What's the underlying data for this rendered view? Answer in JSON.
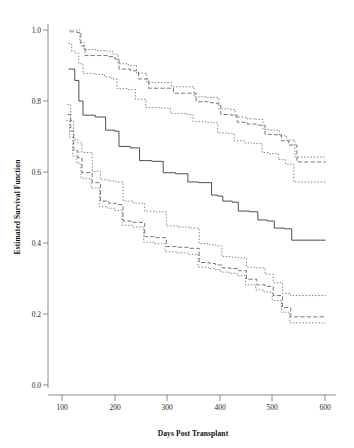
{
  "figure": {
    "background_color": "#ffffff",
    "type": "survival-curve-figure"
  },
  "chart_data": {
    "type": "line",
    "title": "",
    "subtitle": "",
    "xlabel": "Days Post Transplant",
    "ylabel": "Estimated Survival Function",
    "xlim": [
      60,
      620
    ],
    "ylim": [
      0.0,
      1.04
    ],
    "xticks": [
      100,
      200,
      300,
      400,
      500,
      600
    ],
    "xtick_labels": [
      "100",
      "200",
      "300",
      "400",
      "500",
      "600"
    ],
    "yticks": [
      0.0,
      0.2,
      0.4,
      0.6,
      0.8,
      1.0
    ],
    "ytick_labels": [
      "0.0",
      "0.2",
      "0.4",
      "0.6",
      "0.8",
      "1.0"
    ],
    "grid": false,
    "legend": false,
    "legend_position": "none",
    "step_interpolation": "post",
    "annotations": [],
    "series": [
      {
        "name": "Upper confidence band (dotted outer)",
        "style": "dotted",
        "color": "#6a6a6a",
        "x": [
          102,
          108,
          115,
          122,
          130,
          152,
          172,
          186,
          196,
          216,
          232,
          252,
          278,
          300,
          330,
          344,
          368,
          384,
          392,
          412,
          424,
          444,
          462,
          478,
          490,
          510,
          524,
          540,
          600
        ],
        "y": [
          1.0,
          1.0,
          1.0,
          0.965,
          0.945,
          0.942,
          0.94,
          0.932,
          0.905,
          0.9,
          0.878,
          0.852,
          0.852,
          0.84,
          0.84,
          0.812,
          0.81,
          0.81,
          0.778,
          0.776,
          0.755,
          0.75,
          0.748,
          0.72,
          0.718,
          0.702,
          0.69,
          0.642,
          0.642
        ]
      },
      {
        "name": "Upper confidence band (dashed middle)",
        "style": "dashed",
        "color": "#555555",
        "x": [
          102,
          108,
          116,
          124,
          132,
          154,
          176,
          190,
          198,
          220,
          236,
          256,
          282,
          304,
          332,
          348,
          372,
          388,
          396,
          416,
          428,
          448,
          466,
          482,
          494,
          514,
          528,
          544,
          600
        ],
        "y": [
          0.995,
          0.995,
          0.993,
          0.955,
          0.928,
          0.928,
          0.925,
          0.918,
          0.89,
          0.885,
          0.862,
          0.836,
          0.836,
          0.822,
          0.822,
          0.798,
          0.795,
          0.792,
          0.762,
          0.76,
          0.74,
          0.735,
          0.732,
          0.706,
          0.705,
          0.688,
          0.676,
          0.628,
          0.628
        ]
      },
      {
        "name": "Upper confidence band (dotted inner)",
        "style": "dotted",
        "color": "#6a6a6a",
        "x": [
          100,
          106,
          112,
          120,
          128,
          150,
          170,
          184,
          194,
          214,
          230,
          250,
          276,
          298,
          328,
          342,
          366,
          382,
          390,
          410,
          422,
          442,
          460,
          476,
          488,
          508,
          522,
          538,
          600
        ],
        "y": [
          0.962,
          0.94,
          0.935,
          0.905,
          0.878,
          0.875,
          0.868,
          0.862,
          0.835,
          0.832,
          0.805,
          0.782,
          0.78,
          0.765,
          0.762,
          0.742,
          0.74,
          0.738,
          0.71,
          0.708,
          0.688,
          0.682,
          0.68,
          0.655,
          0.652,
          0.635,
          0.622,
          0.572,
          0.572
        ]
      },
      {
        "name": "Estimated survival function (solid)",
        "style": "solid",
        "color": "#3b3b3b",
        "x": [
          100,
          106,
          112,
          120,
          128,
          152,
          172,
          190,
          198,
          220,
          238,
          262,
          284,
          308,
          332,
          352,
          378,
          390,
          400,
          418,
          430,
          452,
          468,
          486,
          500,
          520,
          534,
          600
        ],
        "y": [
          0.89,
          0.89,
          0.858,
          0.8,
          0.76,
          0.755,
          0.718,
          0.715,
          0.672,
          0.668,
          0.632,
          0.63,
          0.598,
          0.595,
          0.572,
          0.57,
          0.535,
          0.532,
          0.518,
          0.515,
          0.49,
          0.488,
          0.465,
          0.462,
          0.442,
          0.44,
          0.408,
          0.408
        ]
      },
      {
        "name": "Lower confidence band (dotted outer)",
        "style": "dotted",
        "color": "#6a6a6a",
        "x": [
          98,
          104,
          110,
          118,
          126,
          146,
          162,
          178,
          192,
          206,
          226,
          248,
          268,
          290,
          312,
          336,
          354,
          374,
          386,
          398,
          414,
          430,
          446,
          466,
          482,
          498,
          516,
          532,
          600
        ],
        "y": [
          0.79,
          0.745,
          0.692,
          0.682,
          0.655,
          0.602,
          0.578,
          0.575,
          0.572,
          0.518,
          0.512,
          0.49,
          0.488,
          0.448,
          0.445,
          0.442,
          0.398,
          0.395,
          0.392,
          0.362,
          0.36,
          0.358,
          0.332,
          0.33,
          0.312,
          0.288,
          0.258,
          0.252,
          0.252
        ]
      },
      {
        "name": "Lower confidence band (dashed middle)",
        "style": "dashed",
        "color": "#555555",
        "x": [
          98,
          104,
          110,
          118,
          126,
          146,
          162,
          178,
          192,
          206,
          226,
          248,
          268,
          290,
          312,
          336,
          354,
          374,
          386,
          398,
          414,
          430,
          446,
          466,
          482,
          498,
          516,
          532,
          600
        ],
        "y": [
          0.762,
          0.715,
          0.66,
          0.64,
          0.598,
          0.57,
          0.518,
          0.512,
          0.508,
          0.462,
          0.458,
          0.418,
          0.415,
          0.39,
          0.388,
          0.385,
          0.345,
          0.342,
          0.338,
          0.33,
          0.328,
          0.322,
          0.298,
          0.282,
          0.278,
          0.252,
          0.218,
          0.192,
          0.192
        ]
      },
      {
        "name": "Lower confidence band (dotted inner)",
        "style": "dotted",
        "color": "#6a6a6a",
        "x": [
          96,
          102,
          108,
          116,
          124,
          144,
          160,
          176,
          190,
          204,
          224,
          246,
          266,
          288,
          310,
          334,
          352,
          372,
          384,
          396,
          412,
          428,
          444,
          464,
          480,
          496,
          514,
          530,
          600
        ],
        "y": [
          0.745,
          0.698,
          0.645,
          0.625,
          0.582,
          0.555,
          0.502,
          0.498,
          0.492,
          0.45,
          0.445,
          0.402,
          0.398,
          0.375,
          0.372,
          0.368,
          0.332,
          0.328,
          0.325,
          0.318,
          0.315,
          0.308,
          0.282,
          0.268,
          0.262,
          0.238,
          0.205,
          0.175,
          0.175
        ]
      }
    ]
  }
}
